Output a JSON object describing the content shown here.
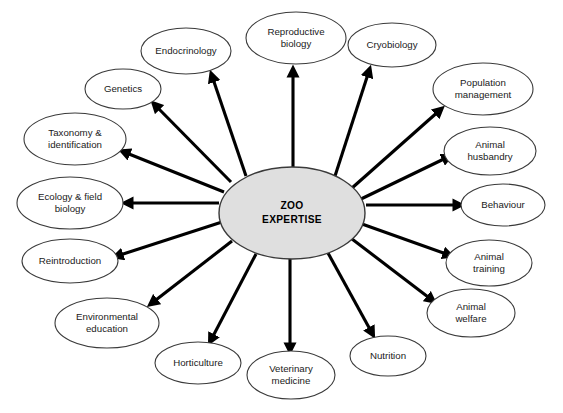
{
  "diagram": {
    "type": "radial-hub-and-spoke",
    "hub": {
      "label_line1": "ZOO",
      "label_line2": "EXPERTISE",
      "cx": 292,
      "cy": 213,
      "rx": 73,
      "ry": 46,
      "fill": "#dfdfdf",
      "stroke": "#3a3a3a"
    },
    "style": {
      "node_fill": "#ffffff",
      "node_stroke": "#3a3a3a",
      "arrow_color": "#000000",
      "background": "#ffffff"
    },
    "nodes": [
      {
        "id": "endocrinology",
        "lines": [
          "Endocrinology"
        ],
        "cx": 186,
        "cy": 51,
        "rx": 45,
        "ry": 23,
        "arrow_from": [
          246,
          176
        ],
        "arrow_to": [
          212,
          76
        ]
      },
      {
        "id": "reproductive-biology",
        "lines": [
          "Reproductive",
          "biology"
        ],
        "cx": 296,
        "cy": 38,
        "rx": 50,
        "ry": 26,
        "arrow_from": [
          293,
          167
        ],
        "arrow_to": [
          293,
          71
        ]
      },
      {
        "id": "cryobiology",
        "lines": [
          "Cryobiology"
        ],
        "cx": 392,
        "cy": 45,
        "rx": 44,
        "ry": 22,
        "arrow_from": [
          335,
          176
        ],
        "arrow_to": [
          369,
          71
        ]
      },
      {
        "id": "population-management",
        "lines": [
          "Population",
          "management"
        ],
        "cx": 483,
        "cy": 89,
        "rx": 50,
        "ry": 26,
        "arrow_from": [
          352,
          188
        ],
        "arrow_to": [
          440,
          110
        ]
      },
      {
        "id": "animal-husbandry",
        "lines": [
          "Animal",
          "husbandry"
        ],
        "cx": 490,
        "cy": 151,
        "rx": 46,
        "ry": 24,
        "arrow_from": [
          361,
          199
        ],
        "arrow_to": [
          448,
          157
        ]
      },
      {
        "id": "behaviour",
        "lines": [
          "Behaviour"
        ],
        "cx": 503,
        "cy": 205,
        "rx": 42,
        "ry": 21,
        "arrow_from": [
          366,
          205
        ],
        "arrow_to": [
          459,
          205
        ]
      },
      {
        "id": "animal-training",
        "lines": [
          "Animal",
          "training"
        ],
        "cx": 489,
        "cy": 263,
        "rx": 43,
        "ry": 23,
        "arrow_from": [
          362,
          224
        ],
        "arrow_to": [
          449,
          255
        ]
      },
      {
        "id": "animal-welfare",
        "lines": [
          "Animal",
          "welfare"
        ],
        "cx": 471,
        "cy": 313,
        "rx": 44,
        "ry": 24,
        "arrow_from": [
          352,
          239
        ],
        "arrow_to": [
          432,
          300
        ]
      },
      {
        "id": "nutrition",
        "lines": [
          "Nutrition"
        ],
        "cx": 388,
        "cy": 356,
        "rx": 38,
        "ry": 20,
        "arrow_from": [
          328,
          253
        ],
        "arrow_to": [
          372,
          333
        ]
      },
      {
        "id": "veterinary-medicine",
        "lines": [
          "Veterinary",
          "medicine"
        ],
        "cx": 291,
        "cy": 375,
        "rx": 44,
        "ry": 24,
        "arrow_from": [
          290,
          259
        ],
        "arrow_to": [
          290,
          349
        ]
      },
      {
        "id": "horticulture",
        "lines": [
          "Horticulture"
        ],
        "cx": 198,
        "cy": 363,
        "rx": 43,
        "ry": 21,
        "arrow_from": [
          256,
          254
        ],
        "arrow_to": [
          211,
          340
        ]
      },
      {
        "id": "environmental-education",
        "lines": [
          "Environmental",
          "education"
        ],
        "cx": 107,
        "cy": 323,
        "rx": 52,
        "ry": 25,
        "arrow_from": [
          232,
          241
        ],
        "arrow_to": [
          152,
          303
        ]
      },
      {
        "id": "reintroduction",
        "lines": [
          "Reintroduction"
        ],
        "cx": 70,
        "cy": 261,
        "rx": 48,
        "ry": 22,
        "arrow_from": [
          222,
          222
        ],
        "arrow_to": [
          117,
          256
        ]
      },
      {
        "id": "ecology-field-biology",
        "lines": [
          "Ecology & field",
          "biology"
        ],
        "cx": 70,
        "cy": 203,
        "rx": 53,
        "ry": 26,
        "arrow_from": [
          219,
          203
        ],
        "arrow_to": [
          127,
          203
        ]
      },
      {
        "id": "taxonomy-identification",
        "lines": [
          "Taxonomy &",
          "identification"
        ],
        "cx": 75,
        "cy": 139,
        "rx": 51,
        "ry": 26,
        "arrow_from": [
          224,
          192
        ],
        "arrow_to": [
          124,
          152
        ]
      },
      {
        "id": "genetics",
        "lines": [
          "Genetics"
        ],
        "cx": 123,
        "cy": 89,
        "rx": 38,
        "ry": 20,
        "arrow_from": [
          231,
          182
        ],
        "arrow_to": [
          155,
          105
        ]
      }
    ]
  },
  "caption": {
    "text": ""
  }
}
